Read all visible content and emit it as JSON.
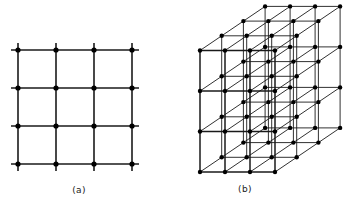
{
  "figure": {
    "background_color": "#ffffff",
    "line_color": "#1a1a1a",
    "node_color": "#000000",
    "panels": [
      {
        "id": "panel-a",
        "caption": "(a)",
        "caption_x": 79,
        "caption_y": 193,
        "type": "2d-square-lattice",
        "grid": {
          "columns": 4,
          "rows": 4,
          "x_positions": [
            18,
            56,
            94,
            132
          ],
          "y_positions": [
            50,
            88,
            126,
            164
          ],
          "stub_length": 7,
          "line_width": 1.6,
          "node_radius": 2.6
        }
      },
      {
        "id": "panel-b",
        "caption": "(b)",
        "caption_x": 245,
        "caption_y": 192,
        "type": "3d-cubic-lattice",
        "grid": {
          "nx": 4,
          "ny": 4,
          "nz": 4,
          "origin_x": 200,
          "origin_y": 172,
          "step_x": 25,
          "step_y": -40.5,
          "depth_dx": 21.7,
          "depth_dy": -14.7,
          "line_width_front": 1.5,
          "line_width_depth": 0.9,
          "node_radius": 2.2
        }
      }
    ]
  }
}
